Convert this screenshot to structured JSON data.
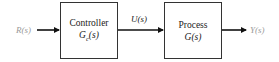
{
  "diagram": {
    "type": "block-diagram",
    "signals": {
      "input": "R(s)",
      "control": "U(s)",
      "output": "Y(s)"
    },
    "blocks": [
      {
        "title": "Controller",
        "transfer_fn": "Gc(s)",
        "tf_base": "G",
        "tf_sub": "c",
        "tf_arg": "(s)"
      },
      {
        "title": "Process",
        "transfer_fn": "G(s)"
      }
    ],
    "colors": {
      "external_signal": "#9a9a9a",
      "line": "#111111",
      "box_border": "#333333"
    }
  }
}
